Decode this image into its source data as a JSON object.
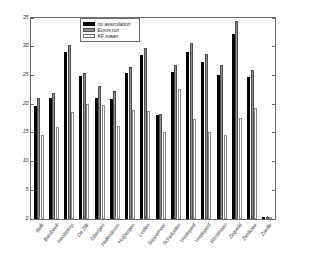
{
  "chart_data": {
    "type": "bar",
    "title": "",
    "xlabel": "",
    "ylabel": "",
    "ylim": [
      0,
      35
    ],
    "yticks": [
      0,
      5,
      10,
      15,
      20,
      25,
      30,
      35
    ],
    "grid": false,
    "legend_position": "top-center",
    "categories": [
      "Balk",
      "Barsbeek",
      "Hoofddorp",
      "De Zilk",
      "Eibergen",
      "Hellendoorn",
      "Huijbergen",
      "Leiden",
      "Sappemeer",
      "Schipluiden",
      "Vredepeel",
      "Vredepeel",
      "Westmaas",
      "Zegveld",
      "Zierikzee",
      "Zwolle"
    ],
    "series": [
      {
        "name": "no assimilation",
        "color": "#000000",
        "values": [
          19.7,
          21.0,
          29.0,
          24.9,
          21.1,
          20.9,
          25.4,
          28.5,
          18.1,
          25.6,
          29.1,
          27.3,
          25.1,
          32.3,
          24.8,
          0.0
        ]
      },
      {
        "name": "Euros run",
        "color": "#8d8d8d",
        "values": [
          21.0,
          22.0,
          30.3,
          25.5,
          23.2,
          22.3,
          26.4,
          29.8,
          18.2,
          26.8,
          30.6,
          28.8,
          26.8,
          34.4,
          25.9,
          0.0
        ]
      },
      {
        "name": "KF mean",
        "color": "#ffffff",
        "values": [
          14.6,
          16.0,
          18.6,
          20.1,
          19.8,
          16.2,
          19.0,
          18.8,
          15.2,
          22.7,
          17.5,
          15.1,
          14.6,
          17.6,
          19.3,
          0.0
        ]
      }
    ]
  },
  "legend": {
    "entries": [
      {
        "label": "no assimilation"
      },
      {
        "label": "Euros run"
      },
      {
        "label": "KF mean"
      }
    ]
  },
  "axis": {
    "y_tick_labels": [
      "0",
      "5",
      "10",
      "15",
      "20",
      "25",
      "30",
      "35"
    ]
  }
}
